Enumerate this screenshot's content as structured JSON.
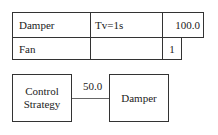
{
  "table": {
    "rows": [
      {
        "name": "Damper",
        "param": "Tv=1s",
        "value": "100.0"
      },
      {
        "name": "Fan",
        "param": "",
        "value": "1"
      }
    ]
  },
  "diagram": {
    "source_block": {
      "line1": "Control",
      "line2": "Strategy"
    },
    "connection_value": "50.0",
    "target_block": {
      "label": "Damper"
    }
  }
}
